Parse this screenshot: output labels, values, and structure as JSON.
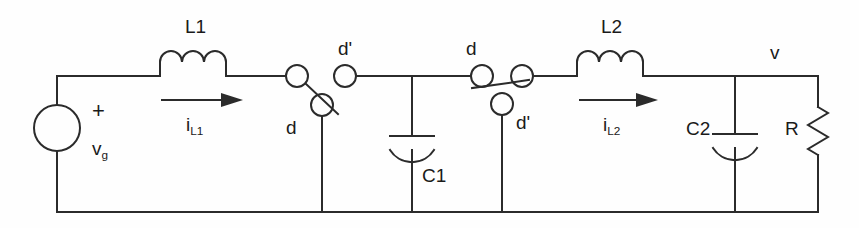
{
  "diagram": {
    "stroke_color": "#2b2b2b",
    "text_color": "#1a1a1a",
    "background": "#fefefe",
    "line_width": 2
  },
  "labels": {
    "l1": "L1",
    "l2": "L2",
    "c1": "C1",
    "c2": "C2",
    "r": "R",
    "vg": "v",
    "vg_sub": "g",
    "plus": "+",
    "v_out": "v",
    "i_l1": "i",
    "i_l1_sub": "L1",
    "i_l2": "i",
    "i_l2_sub": "L2",
    "sw1_d": "d",
    "sw1_dprime": "d'",
    "sw2_d": "d",
    "sw2_dprime": "d'"
  },
  "components": [
    {
      "name": "source-vg",
      "type": "voltage-source",
      "label": "vg"
    },
    {
      "name": "inductor-l1",
      "type": "inductor",
      "label": "L1"
    },
    {
      "name": "switch-1",
      "type": "spdt-switch",
      "poles": [
        "d",
        "d'"
      ]
    },
    {
      "name": "capacitor-c1",
      "type": "capacitor",
      "label": "C1"
    },
    {
      "name": "switch-2",
      "type": "spdt-switch",
      "poles": [
        "d",
        "d'"
      ]
    },
    {
      "name": "inductor-l2",
      "type": "inductor",
      "label": "L2"
    },
    {
      "name": "capacitor-c2",
      "type": "capacitor",
      "label": "C2"
    },
    {
      "name": "resistor-r",
      "type": "resistor",
      "label": "R"
    }
  ],
  "currents": [
    {
      "name": "i-l1",
      "label": "iL1",
      "direction": "right"
    },
    {
      "name": "i-l2",
      "label": "iL2",
      "direction": "right"
    }
  ],
  "nodes": [
    {
      "name": "output-node",
      "label": "v"
    }
  ]
}
